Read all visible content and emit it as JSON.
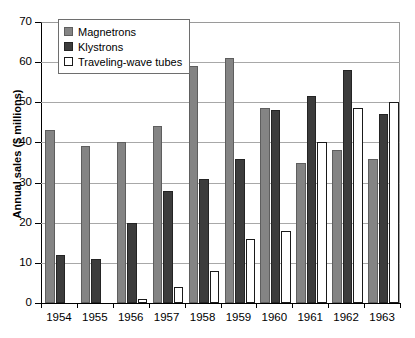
{
  "chart_data": {
    "type": "bar",
    "title": "",
    "xlabel": "",
    "ylabel": "Annual sales ($ millions)",
    "categories": [
      "1954",
      "1955",
      "1956",
      "1957",
      "1958",
      "1959",
      "1960",
      "1961",
      "1962",
      "1963"
    ],
    "series": [
      {
        "name": "Magnetrons",
        "color": "#848484",
        "values": [
          43,
          39,
          40,
          44,
          59,
          61,
          48.5,
          35,
          38,
          36
        ]
      },
      {
        "name": "Klystrons",
        "color": "#3c3c3c",
        "values": [
          12,
          11,
          20,
          28,
          31,
          36,
          48,
          51.5,
          58,
          47
        ]
      },
      {
        "name": "Traveling-wave tubes",
        "color": "#ffffff",
        "values": [
          0,
          0,
          1,
          4,
          8,
          16,
          18,
          40,
          48.5,
          50
        ]
      }
    ],
    "ylim": [
      0,
      70
    ],
    "yticks": [
      0,
      10,
      20,
      30,
      40,
      50,
      60,
      70
    ],
    "ytick_labels": [
      "0",
      "10",
      "20",
      "30",
      "40",
      "50",
      "60",
      "70"
    ],
    "grid": true,
    "legend_position": "top-left"
  },
  "legend": {
    "items": [
      {
        "label": "Magnetrons"
      },
      {
        "label": "Klystrons"
      },
      {
        "label": "Traveling-wave tubes"
      }
    ]
  }
}
